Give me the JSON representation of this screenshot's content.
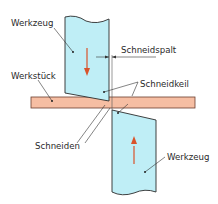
{
  "diagram": {
    "labels": {
      "tool_top": "Werkzeug",
      "gap": "Schneidspalt",
      "workpiece": "Werkstück",
      "wedge": "Schneidkeil",
      "edges": "Schneiden",
      "tool_bottom": "Werkzeug"
    },
    "colors": {
      "tool_fill": "#bfeef6",
      "workpiece_fill": "#f6bea3",
      "arrow": "#d9532b",
      "outline": "#2b2b2b"
    }
  }
}
